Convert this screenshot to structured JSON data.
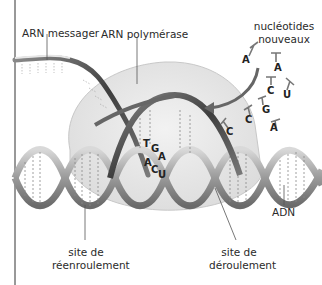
{
  "diagram": {
    "type": "transcription",
    "labels": {
      "mrna": "ARN messager",
      "polymerase": "ARN polymérase",
      "nucleotides_line1": "nucléotides",
      "nucleotides_line2": "nouveaux",
      "dna": "ADN",
      "rewinding_line1": "site de",
      "rewinding_line2": "réenroulement",
      "unwinding_line1": "site de",
      "unwinding_line2": "déroulement"
    },
    "free_nucleotides": [
      "A",
      "A",
      "C",
      "U",
      "G",
      "C",
      "A",
      "C"
    ],
    "paired_bases": {
      "template": [
        "T",
        "G",
        "A"
      ],
      "rna": [
        "A",
        "C",
        "U"
      ]
    },
    "colors": {
      "polymerase_fill": "#e8e8e8",
      "strand_dark": "#555555",
      "strand_light": "#b5b5b5",
      "text": "#2a2a2a"
    }
  }
}
